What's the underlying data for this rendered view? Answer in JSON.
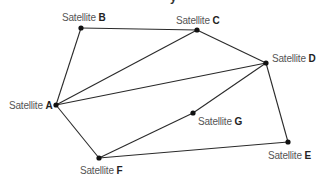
{
  "title_fragment": "y",
  "nodes": [
    {
      "id": "A",
      "prefix": "Satellite",
      "letter": "A",
      "x": 56,
      "y": 105,
      "label_x": 9,
      "label_y": 100
    },
    {
      "id": "B",
      "prefix": "Satellite",
      "letter": "B",
      "x": 81,
      "y": 28,
      "label_x": 62,
      "label_y": 12
    },
    {
      "id": "C",
      "prefix": "Satellite",
      "letter": "C",
      "x": 197,
      "y": 30,
      "label_x": 176,
      "label_y": 15
    },
    {
      "id": "D",
      "prefix": "Satellite",
      "letter": "D",
      "x": 266,
      "y": 63,
      "label_x": 272,
      "label_y": 53
    },
    {
      "id": "E",
      "prefix": "Satellite",
      "letter": "E",
      "x": 288,
      "y": 142,
      "label_x": 268,
      "label_y": 150
    },
    {
      "id": "F",
      "prefix": "Satellite",
      "letter": "F",
      "x": 99,
      "y": 158,
      "label_x": 80,
      "label_y": 165
    },
    {
      "id": "G",
      "prefix": "Satellite",
      "letter": "G",
      "x": 193,
      "y": 113,
      "label_x": 198,
      "label_y": 116
    }
  ],
  "edges": [
    [
      "A",
      "B"
    ],
    [
      "B",
      "C"
    ],
    [
      "A",
      "C"
    ],
    [
      "A",
      "D"
    ],
    [
      "C",
      "D"
    ],
    [
      "A",
      "F"
    ],
    [
      "D",
      "G"
    ],
    [
      "G",
      "F"
    ],
    [
      "D",
      "E"
    ],
    [
      "F",
      "E"
    ]
  ],
  "labels": {
    "A": {
      "prefix": "Satellite",
      "letter": "A"
    },
    "B": {
      "prefix": "Satellite",
      "letter": "B"
    },
    "C": {
      "prefix": "Satellite",
      "letter": "C"
    },
    "D": {
      "prefix": "Satellite",
      "letter": "D"
    },
    "E": {
      "prefix": "Satellite",
      "letter": "E"
    },
    "F": {
      "prefix": "Satellite",
      "letter": "F"
    },
    "G": {
      "prefix": "Satellite",
      "letter": "G"
    }
  }
}
